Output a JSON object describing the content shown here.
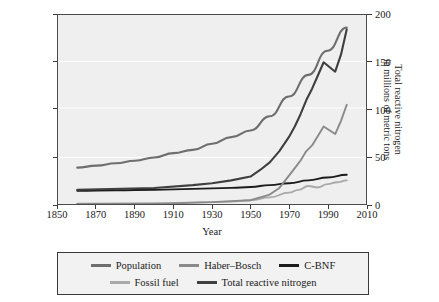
{
  "chart_data": {
    "type": "line",
    "title": "",
    "xlabel": "Year",
    "ylabel_left": "World population in billions",
    "ylabel_right_line1": "Total reactive nitrogen",
    "ylabel_right_line2": "in millions of metric tons",
    "xlim": [
      1850,
      2010
    ],
    "xticks": [
      1850,
      1870,
      1890,
      1910,
      1930,
      1950,
      1970,
      1990,
      2010
    ],
    "ylim_left": [
      0.0,
      6.5
    ],
    "yticks_left": [
      "0.0",
      "1.6",
      "3.3",
      "4.9",
      "6.5"
    ],
    "yticks_left_values": [
      0.0,
      1.6,
      3.3,
      4.9,
      6.5
    ],
    "ylim_right": [
      0,
      200
    ],
    "yticks_right": [
      "0",
      "50",
      "100",
      "150",
      "200"
    ],
    "yticks_right_values": [
      0,
      50,
      100,
      150,
      200
    ],
    "grid": true,
    "legend_position": "below-plot",
    "colors": {
      "population": "#6e6e6e",
      "haber_bosch": "#8a8a8a",
      "c_bnf": "#1c1c1c",
      "fossil_fuel": "#a9a9a9",
      "total_reactive_nitrogen": "#3f3f3f",
      "plot_background": "#efefef",
      "grid": "#ffffff",
      "frame": "#4a4a4a"
    },
    "series": [
      {
        "name": "Population",
        "axis": "left",
        "unit": "billions",
        "x": [
          1860,
          1870,
          1880,
          1890,
          1900,
          1910,
          1920,
          1930,
          1940,
          1950,
          1960,
          1970,
          1980,
          1990,
          2000
        ],
        "values": [
          1.25,
          1.32,
          1.4,
          1.49,
          1.6,
          1.75,
          1.86,
          2.07,
          2.3,
          2.53,
          3.02,
          3.7,
          4.44,
          5.27,
          6.07
        ]
      },
      {
        "name": "Haber–Bosch",
        "axis": "right",
        "unit": "Mt N",
        "x": [
          1860,
          1900,
          1910,
          1920,
          1930,
          1940,
          1950,
          1955,
          1960,
          1965,
          1970,
          1973,
          1976,
          1979,
          1982,
          1985,
          1988,
          1991,
          1994,
          1997,
          2000
        ],
        "values": [
          0,
          0,
          0.5,
          1.5,
          2.0,
          3.0,
          4.0,
          7.0,
          10.0,
          17.0,
          30.0,
          38.0,
          46.0,
          56.0,
          62.0,
          72.0,
          82.0,
          78.0,
          74.0,
          88.0,
          105.0
        ]
      },
      {
        "name": "C-BNF",
        "axis": "right",
        "unit": "Mt N",
        "x": [
          1860,
          1880,
          1900,
          1920,
          1940,
          1950,
          1960,
          1970,
          1980,
          1990,
          2000
        ],
        "values": [
          14.0,
          14.5,
          15.0,
          16.0,
          17.0,
          18.0,
          20.0,
          22.0,
          25.0,
          28.0,
          31.0
        ]
      },
      {
        "name": "Fossil fuel",
        "axis": "right",
        "unit": "Mt N",
        "x": [
          1860,
          1900,
          1920,
          1940,
          1950,
          1960,
          1970,
          1975,
          1980,
          1985,
          1990,
          1995,
          2000
        ],
        "values": [
          0.3,
          0.8,
          1.5,
          2.5,
          4.0,
          7.0,
          12.0,
          15.0,
          19.0,
          17.5,
          21.0,
          23.0,
          25.0
        ]
      },
      {
        "name": "Total reactive nitrogen",
        "axis": "right",
        "unit": "Mt N",
        "x": [
          1860,
          1900,
          1920,
          1930,
          1940,
          1950,
          1955,
          1960,
          1965,
          1970,
          1973,
          1976,
          1979,
          1982,
          1985,
          1988,
          1991,
          1994,
          1997,
          2000
        ],
        "values": [
          15.0,
          17.0,
          20.0,
          22.0,
          25.0,
          29.0,
          36.0,
          44.0,
          56.0,
          71.0,
          82.0,
          95.0,
          110.0,
          122.0,
          136.0,
          150.0,
          145.0,
          140.0,
          158.0,
          185.0
        ]
      }
    ]
  },
  "legend": {
    "rows": [
      [
        {
          "label": "Population",
          "color_key": "population"
        },
        {
          "label": "Haber–Bosch",
          "color_key": "haber_bosch"
        },
        {
          "label": "C-BNF",
          "color_key": "c_bnf"
        }
      ],
      [
        {
          "label": "Fossil fuel",
          "color_key": "fossil_fuel"
        },
        {
          "label": "Total reactive nitrogen",
          "color_key": "total_reactive_nitrogen"
        }
      ]
    ]
  }
}
